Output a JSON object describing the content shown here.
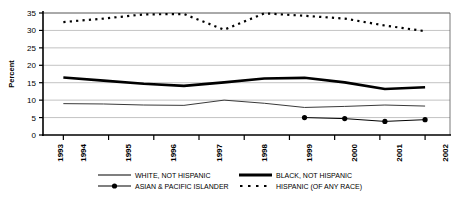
{
  "chart_data": {
    "type": "line",
    "title": "",
    "xlabel": "",
    "ylabel": "Percent",
    "x": [
      1993,
      1994,
      1995,
      1996,
      1997,
      1998,
      1999,
      2000,
      2001,
      2002
    ],
    "categories": [
      "1993",
      "1994",
      "1995",
      "1996",
      "1997",
      "1998",
      "1999",
      "2000",
      "2001",
      "2002"
    ],
    "ylim": [
      0,
      35
    ],
    "yticks": [
      0,
      5,
      10,
      15,
      20,
      25,
      30,
      35
    ],
    "ytick_labels": [
      "0",
      "5",
      "10",
      "15",
      "20",
      "25",
      "30",
      "35"
    ],
    "grid": true,
    "legend_position": "bottom",
    "series": [
      {
        "name": "WHITE, NOT HISPANIC",
        "style": "solid-thin",
        "color": "#3a3a3a",
        "marker": "none",
        "values": [
          9.0,
          8.9,
          8.6,
          8.5,
          10.0,
          9.1,
          7.9,
          8.2,
          8.6,
          8.3
        ]
      },
      {
        "name": "BLACK, NOT HISPANIC",
        "style": "solid-thick",
        "color": "#000000",
        "marker": "none",
        "values": [
          16.5,
          15.6,
          14.7,
          14.1,
          15.1,
          16.2,
          16.4,
          15.1,
          13.2,
          13.7
        ]
      },
      {
        "name": "ASIAN & PACIFIC ISLANDER",
        "style": "solid-marker",
        "color": "#000000",
        "marker": "circle",
        "values": [
          null,
          null,
          null,
          null,
          null,
          null,
          5.0,
          4.7,
          3.9,
          4.4
        ]
      },
      {
        "name": "HISPANIC (OF ANY RACE)",
        "style": "dotted",
        "color": "#000000",
        "marker": "none",
        "values": [
          32.4,
          33.4,
          34.6,
          34.7,
          30.2,
          34.9,
          34.2,
          33.4,
          31.4,
          29.8
        ]
      }
    ]
  },
  "axis": {
    "y_label": "Percent",
    "y_ticks": [
      "35",
      "30",
      "25",
      "20",
      "15",
      "10",
      "5",
      "0"
    ],
    "x_ticks": [
      "1993",
      "1994",
      "1995",
      "1996",
      "1997",
      "1998",
      "1999",
      "2000",
      "2001",
      "2002"
    ]
  },
  "legend": {
    "entries": [
      {
        "label": "WHITE, NOT HISPANIC",
        "swatch": "solid-thin-line"
      },
      {
        "label": "BLACK, NOT HISPANIC",
        "swatch": "solid-thick-line"
      },
      {
        "label": "ASIAN & PACIFIC ISLANDER",
        "swatch": "line-with-dot-marker"
      },
      {
        "label": "HISPANIC (OF ANY RACE)",
        "swatch": "dashed-line"
      }
    ]
  },
  "colors": {
    "background": "#ffffff",
    "grid": "#9a9a9a",
    "axis": "#000000",
    "series_black": "#000000",
    "series_white_line": "#3a3a3a"
  }
}
